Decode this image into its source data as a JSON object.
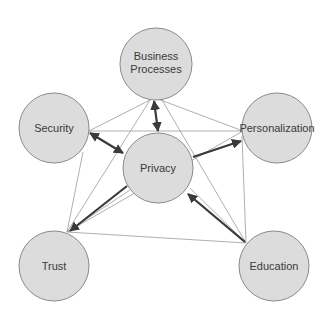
{
  "diagram": {
    "type": "concept-network",
    "colors": {
      "node_fill": "#dcdcdc",
      "node_stroke": "#8a8a8a",
      "thin_edge": "#8c8c8c",
      "thick_edge": "#3a3a3a",
      "text": "#3a3a3a"
    },
    "nodes": [
      {
        "id": "business",
        "label_line1": "Business",
        "label_line2": "Processes",
        "cx": 156,
        "cy": 64,
        "r": 36
      },
      {
        "id": "security",
        "label": "Security",
        "cx": 54,
        "cy": 128,
        "r": 35
      },
      {
        "id": "personalization",
        "label": "Personalization",
        "cx": 277,
        "cy": 128,
        "r": 35
      },
      {
        "id": "privacy",
        "label": "Privacy",
        "cx": 158,
        "cy": 168,
        "r": 35
      },
      {
        "id": "trust",
        "label": "Trust",
        "cx": 54,
        "cy": 266,
        "r": 35
      },
      {
        "id": "education",
        "label": "Education",
        "cx": 274,
        "cy": 266,
        "r": 35
      }
    ],
    "thick_edges": [
      {
        "from": "business",
        "to": "privacy",
        "direction": "both"
      },
      {
        "from": "security",
        "to": "privacy",
        "direction": "both"
      },
      {
        "from": "privacy",
        "to": "personalization",
        "direction": "forward"
      },
      {
        "from": "privacy",
        "to": "trust",
        "direction": "forward"
      },
      {
        "from": "education",
        "to": "privacy",
        "direction": "forward"
      }
    ],
    "thin_edges": [
      {
        "from": "business",
        "to": "security"
      },
      {
        "from": "business",
        "to": "personalization"
      },
      {
        "from": "business",
        "to": "trust"
      },
      {
        "from": "business",
        "to": "education"
      },
      {
        "from": "security",
        "to": "personalization"
      },
      {
        "from": "security",
        "to": "trust"
      },
      {
        "from": "personalization",
        "to": "education"
      },
      {
        "from": "personalization",
        "to": "trust"
      },
      {
        "from": "trust",
        "to": "education"
      },
      {
        "from": "privacy",
        "to": "education"
      },
      {
        "from": "privacy",
        "to": "trust"
      }
    ]
  }
}
